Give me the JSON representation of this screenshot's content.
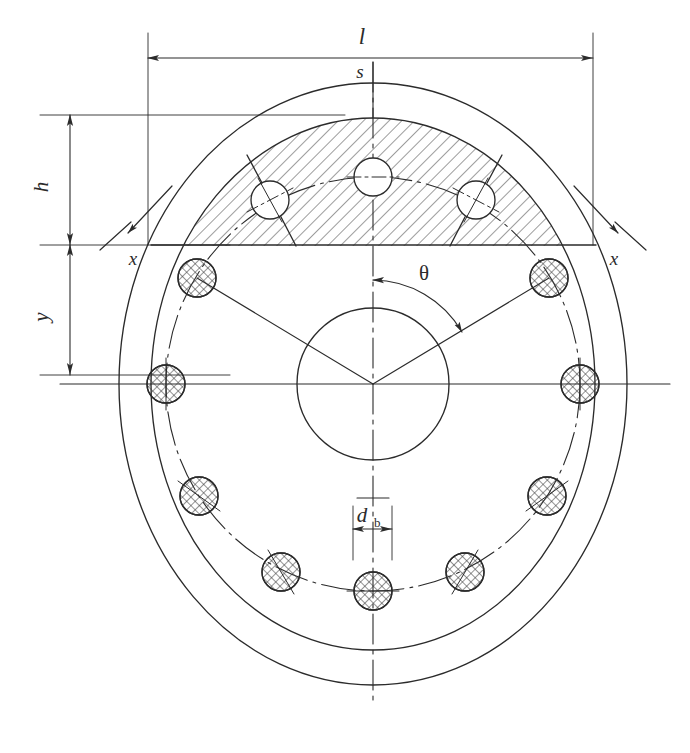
{
  "figure": {
    "kind": "engineering-drawing",
    "title_visible": false,
    "stroke_color": "#2b2b2b",
    "hatch_color": "#4a4a4a",
    "background": "#ffffff"
  },
  "labels": {
    "length": "l",
    "segment_height": "s",
    "height": "h",
    "distance_y": "y",
    "section_left": "x",
    "section_right": "x",
    "angle": "θ",
    "bolt_diameter": "d",
    "bolt_diameter_sub": "b"
  },
  "geometry": {
    "center": {
      "cx": 373,
      "cy": 384
    },
    "outer_flange": {
      "rx": 254,
      "ry": 301,
      "note": "outermost plate outline"
    },
    "inner_flange": {
      "rx": 222,
      "ry": 266,
      "note": "inner gasket / shell circle, edge of hatched segment"
    },
    "bore_circle": {
      "r": 76,
      "note": "central bore"
    },
    "bolt_circle": {
      "r": 207,
      "note": "pitch circle of bolts, dash-dot"
    },
    "bolt_count": 11,
    "bolt_diameter_px": 38,
    "upper_hole_count": 3,
    "upper_hole_diameter_px": 38,
    "section_line_y": 245,
    "angle_between_bolts_deg": 32.7
  },
  "dimensions": {
    "l": {
      "from_x": 148,
      "to_x": 593,
      "y": 58,
      "label": "l"
    },
    "h": {
      "from_y": 115,
      "to_y": 245,
      "x": 70,
      "label": "h"
    },
    "y": {
      "from_y": 245,
      "to_y": 375,
      "x": 70,
      "label": "y"
    },
    "d_b": {
      "from_x": 353,
      "to_x": 392,
      "y": 529,
      "label": "d",
      "sub": "b"
    }
  },
  "bolts": [
    {
      "index": 1,
      "angle_deg": 90,
      "cx": 373,
      "cy": 177,
      "type": "open-hole"
    },
    {
      "index": 2,
      "angle_deg": 122.7,
      "cx": 270,
      "cy": 200,
      "type": "open-hole"
    },
    {
      "index": 3,
      "angle_deg": 57.3,
      "cx": 476,
      "cy": 200,
      "type": "open-hole"
    },
    {
      "index": 4,
      "angle_deg": 155.4,
      "cx": 197,
      "cy": 278,
      "type": "cross-hatched-bolt"
    },
    {
      "index": 5,
      "angle_deg": 24.6,
      "cx": 549,
      "cy": 278,
      "type": "cross-hatched-bolt"
    },
    {
      "index": 6,
      "angle_deg": 180,
      "cx": 166,
      "cy": 384,
      "type": "cross-hatched-bolt"
    },
    {
      "index": 7,
      "angle_deg": 0,
      "cx": 580,
      "cy": 384,
      "type": "cross-hatched-bolt"
    },
    {
      "index": 8,
      "angle_deg": 212.7,
      "cx": 199,
      "cy": 496,
      "type": "cross-hatched-bolt"
    },
    {
      "index": 9,
      "angle_deg": 327.3,
      "cx": 547,
      "cy": 496,
      "type": "cross-hatched-bolt"
    },
    {
      "index": 10,
      "angle_deg": 245.4,
      "cx": 281,
      "cy": 572,
      "type": "cross-hatched-bolt"
    },
    {
      "index": 11,
      "angle_deg": 294.6,
      "cx": 465,
      "cy": 572,
      "type": "cross-hatched-bolt"
    },
    {
      "index": 12,
      "angle_deg": 270,
      "cx": 373,
      "cy": 591,
      "type": "cross-hatched-bolt"
    }
  ]
}
